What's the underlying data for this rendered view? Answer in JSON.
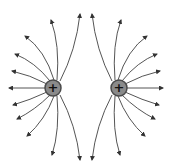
{
  "diagram": {
    "charges": [
      {
        "id": "left",
        "sign": "+",
        "label": "+"
      },
      {
        "id": "right",
        "sign": "+",
        "label": "+"
      }
    ],
    "colors": {
      "line": "#555555",
      "charge_fill": "#8a8a8a",
      "charge_stroke": "#4a4a4a",
      "sign": "#111111"
    }
  }
}
